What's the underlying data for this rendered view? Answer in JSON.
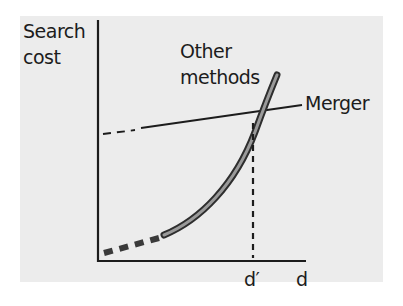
{
  "diagram": {
    "y_axis_label_line1": "Search",
    "y_axis_label_line2": "cost",
    "x_axis_label": "d",
    "crossover_label": "d′",
    "curve_label_line1": "Other",
    "curve_label_line2": "methods",
    "line_label": "Merger",
    "colors": {
      "background": "#ececec",
      "ink": "#1c1c1c",
      "curve_fill": "#8a8a8a"
    }
  }
}
